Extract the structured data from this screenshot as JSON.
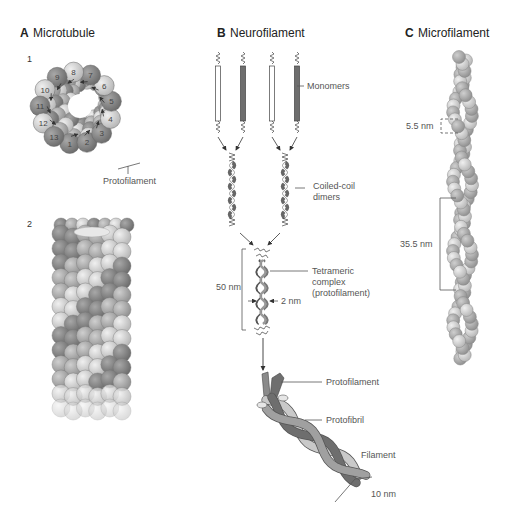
{
  "panels": {
    "a": {
      "letter": "A",
      "title": "Microtubule",
      "sub1": "1",
      "sub2": "2",
      "protofilament_numbers": [
        "1",
        "2",
        "3",
        "4",
        "5",
        "6",
        "7",
        "8",
        "9",
        "10",
        "11",
        "12",
        "13"
      ],
      "protofilament_label": "Protofilament"
    },
    "b": {
      "letter": "B",
      "title": "Neurofilament",
      "monomers_label": "Monomers",
      "dimers_label_1": "Coiled-coil",
      "dimers_label_2": "dimers",
      "tetramer_label_1": "Tetrameric",
      "tetramer_label_2": "complex",
      "tetramer_label_3": "(protofilament)",
      "length_label": "50 nm",
      "width_label": "2 nm",
      "protofilament_label": "Protofilament",
      "protofibril_label": "Protofibril",
      "filament_label": "Filament",
      "diameter_label": "10 nm"
    },
    "c": {
      "letter": "C",
      "title": "Microfilament",
      "subunit_spacing_label": "5.5 nm",
      "helix_repeat_label": "35.5 nm"
    }
  },
  "colors": {
    "dark_subunit": "#7d7d7d",
    "mid_subunit": "#a6a6a6",
    "light_subunit": "#d4d4d4",
    "line": "#555555"
  }
}
